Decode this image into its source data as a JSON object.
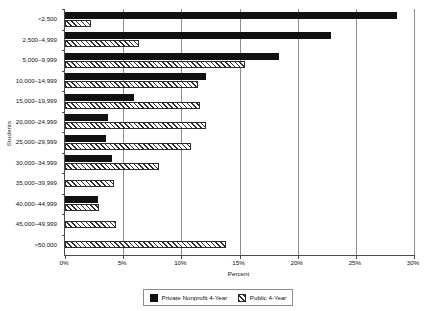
{
  "chart_data": {
    "type": "bar",
    "orientation": "horizontal",
    "title": "",
    "xlabel": "Percent",
    "ylabel": "Students",
    "xlim": [
      0,
      30
    ],
    "xticks": [
      "0%",
      "5%",
      "10%",
      "15%",
      "20%",
      "25%",
      "30%"
    ],
    "xtick_values": [
      0,
      5,
      10,
      15,
      20,
      25,
      30
    ],
    "grid": "vertical",
    "legend_position": "bottom",
    "categories": [
      "<2,500",
      "2,500–4,999",
      "5,000–9,999",
      "10,000–14,999",
      "15,000–19,999",
      "20,000–24,999",
      "25,000–29,999",
      "30,000–34,999",
      "35,000–39,999",
      "40,000–44,999",
      "45,000–49,999",
      ">50,000"
    ],
    "series": [
      {
        "name": "Private Nonprofit 4-Year",
        "fill": "solid-black",
        "color": "#111111",
        "values": [
          28.5,
          22.9,
          18.4,
          12.1,
          5.9,
          3.7,
          3.5,
          4.0,
          0,
          2.8,
          0,
          0
        ]
      },
      {
        "name": "Public 4-Year",
        "fill": "diagonal-hatch",
        "color": "#2b2b2b",
        "values": [
          2.2,
          6.4,
          15.5,
          11.4,
          11.6,
          12.1,
          10.8,
          8.1,
          4.2,
          2.9,
          4.4,
          13.8
        ]
      }
    ]
  },
  "legend": {
    "items": [
      {
        "label": "Private Nonprofit 4-Year",
        "icon": "solid-square-swatch"
      },
      {
        "label": "Public 4-Year",
        "icon": "hatched-square-swatch"
      }
    ]
  }
}
